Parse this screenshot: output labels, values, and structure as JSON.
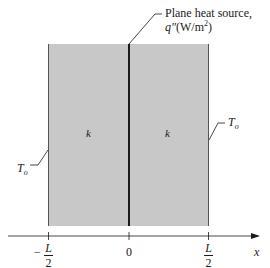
{
  "diagram": {
    "source_label_line1": "Plane heat source,",
    "source_label_q": "q″",
    "source_label_units_open": "(W/m",
    "source_label_units_sup": "2",
    "source_label_units_close": ")",
    "left_region_label": "k",
    "right_region_label": "k",
    "left_boundary_temp": "T",
    "left_boundary_temp_sub": "o",
    "right_boundary_temp": "T",
    "right_boundary_temp_sub": "o",
    "axis": {
      "variable": "x",
      "ticks": [
        {
          "sign": "−",
          "numerator": "L",
          "denominator": "2"
        },
        {
          "value": "0"
        },
        {
          "numerator": "L",
          "denominator": "2"
        }
      ]
    },
    "colors": {
      "slab_fill": "#c8c8c8",
      "line": "#1a1a1a",
      "background": "#ffffff"
    }
  }
}
